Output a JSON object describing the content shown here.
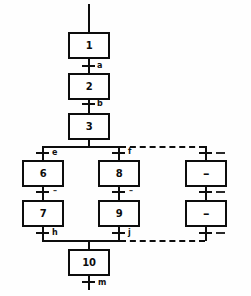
{
  "diagram": {
    "type": "sfc-grafcet",
    "line_color": "#0d0d0d",
    "background_color": "#fefefe"
  },
  "steps": [
    {
      "id": "step-1",
      "label": "1"
    },
    {
      "id": "step-2",
      "label": "2"
    },
    {
      "id": "step-3",
      "label": "3"
    },
    {
      "id": "step-6",
      "label": "6"
    },
    {
      "id": "step-7",
      "label": "7"
    },
    {
      "id": "step-8",
      "label": "8"
    },
    {
      "id": "step-9",
      "label": "9"
    },
    {
      "id": "step-10",
      "label": "10"
    },
    {
      "id": "step-placeholder-upper",
      "label": "–"
    },
    {
      "id": "step-placeholder-lower",
      "label": "–"
    }
  ],
  "transitions": [
    {
      "id": "transition-a",
      "label": "a"
    },
    {
      "id": "transition-b",
      "label": "b"
    },
    {
      "id": "transition-e",
      "label": "e"
    },
    {
      "id": "transition-f",
      "label": "f"
    },
    {
      "id": "transition-g",
      "label": "–"
    },
    {
      "id": "transition-i",
      "label": "–"
    },
    {
      "id": "transition-h",
      "label": "h"
    },
    {
      "id": "transition-j",
      "label": "j"
    },
    {
      "id": "transition-m",
      "label": "m"
    },
    {
      "id": "transition-branch3-top",
      "label": "–"
    },
    {
      "id": "transition-branch3-mid",
      "label": "–"
    },
    {
      "id": "transition-branch3-bottom",
      "label": "–"
    }
  ]
}
